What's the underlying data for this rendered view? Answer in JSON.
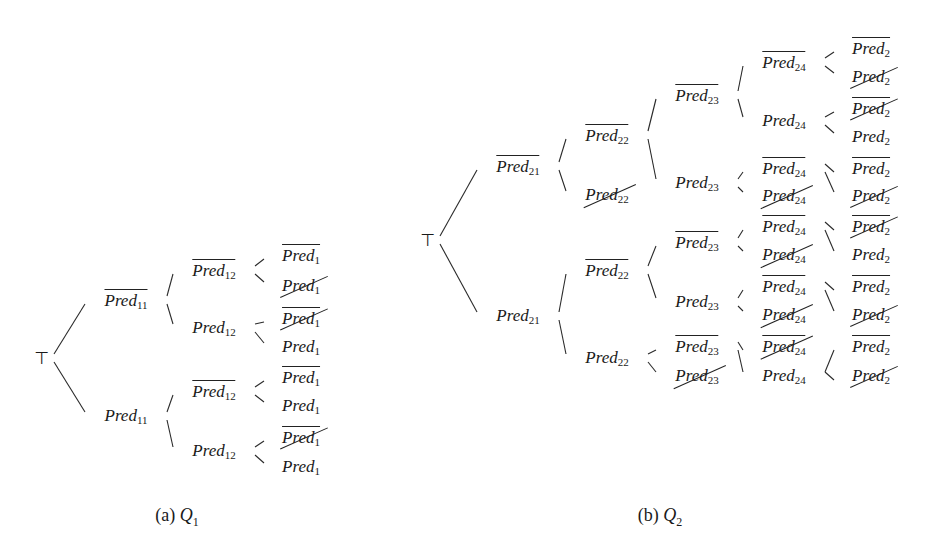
{
  "figure": {
    "captions": [
      {
        "id": "a",
        "label": "(a)",
        "var": "Q",
        "sub": "1",
        "x": 177,
        "y": 505
      },
      {
        "id": "b",
        "label": "(b)",
        "var": "Q",
        "sub": "2",
        "x": 660,
        "y": 505
      }
    ],
    "trees": [
      {
        "id": "Q1",
        "root": {
          "symbol": "⊤",
          "x": 42,
          "y": 358
        },
        "nodes": [
          {
            "id": "a1",
            "base": "Pred",
            "sub": "11",
            "neg": true,
            "struck": false,
            "x": 126,
            "y": 300,
            "parent": "root"
          },
          {
            "id": "a2",
            "base": "Pred",
            "sub": "11",
            "neg": false,
            "struck": false,
            "x": 126,
            "y": 416,
            "parent": "root"
          },
          {
            "id": "a3",
            "base": "Pred",
            "sub": "12",
            "neg": true,
            "struck": false,
            "x": 214,
            "y": 270,
            "parent": "a1"
          },
          {
            "id": "a4",
            "base": "Pred",
            "sub": "12",
            "neg": false,
            "struck": false,
            "x": 214,
            "y": 328,
            "parent": "a1"
          },
          {
            "id": "a5",
            "base": "Pred",
            "sub": "12",
            "neg": true,
            "struck": false,
            "x": 214,
            "y": 391,
            "parent": "a2"
          },
          {
            "id": "a6",
            "base": "Pred",
            "sub": "12",
            "neg": false,
            "struck": false,
            "x": 214,
            "y": 451,
            "parent": "a2"
          },
          {
            "id": "a7",
            "base": "Pred",
            "sub": "1",
            "neg": true,
            "struck": false,
            "x": 301,
            "y": 255,
            "parent": "a3"
          },
          {
            "id": "a8",
            "base": "Pred",
            "sub": "1",
            "neg": false,
            "struck": true,
            "x": 301,
            "y": 286,
            "parent": "a3"
          },
          {
            "id": "a9",
            "base": "Pred",
            "sub": "1",
            "neg": true,
            "struck": true,
            "x": 301,
            "y": 318,
            "parent": "a4"
          },
          {
            "id": "a10",
            "base": "Pred",
            "sub": "1",
            "neg": false,
            "struck": false,
            "x": 301,
            "y": 347,
            "parent": "a4"
          },
          {
            "id": "a11",
            "base": "Pred",
            "sub": "1",
            "neg": true,
            "struck": false,
            "x": 301,
            "y": 377,
            "parent": "a5"
          },
          {
            "id": "a12",
            "base": "Pred",
            "sub": "1",
            "neg": false,
            "struck": false,
            "x": 301,
            "y": 406,
            "parent": "a5"
          },
          {
            "id": "a13",
            "base": "Pred",
            "sub": "1",
            "neg": true,
            "struck": true,
            "x": 301,
            "y": 437,
            "parent": "a6"
          },
          {
            "id": "a14",
            "base": "Pred",
            "sub": "1",
            "neg": false,
            "struck": false,
            "x": 301,
            "y": 467,
            "parent": "a6"
          }
        ]
      },
      {
        "id": "Q2",
        "root": {
          "symbol": "⊤",
          "x": 428,
          "y": 240
        },
        "nodes": [
          {
            "id": "b1",
            "base": "Pred",
            "sub": "21",
            "neg": true,
            "struck": false,
            "x": 518,
            "y": 166,
            "parent": "root"
          },
          {
            "id": "b2",
            "base": "Pred",
            "sub": "21",
            "neg": false,
            "struck": false,
            "x": 518,
            "y": 316,
            "parent": "root"
          },
          {
            "id": "b3",
            "base": "Pred",
            "sub": "22",
            "neg": true,
            "struck": false,
            "x": 607,
            "y": 135,
            "parent": "b1"
          },
          {
            "id": "b4",
            "base": "Pred",
            "sub": "22",
            "neg": false,
            "struck": true,
            "x": 607,
            "y": 195,
            "parent": "b1"
          },
          {
            "id": "b5",
            "base": "Pred",
            "sub": "22",
            "neg": true,
            "struck": false,
            "x": 607,
            "y": 270,
            "parent": "b2"
          },
          {
            "id": "b6",
            "base": "Pred",
            "sub": "22",
            "neg": false,
            "struck": false,
            "x": 607,
            "y": 358,
            "parent": "b2"
          },
          {
            "id": "b7",
            "base": "Pred",
            "sub": "23",
            "neg": true,
            "struck": false,
            "x": 697,
            "y": 95,
            "parent": "b3"
          },
          {
            "id": "b8",
            "base": "Pred",
            "sub": "23",
            "neg": false,
            "struck": false,
            "x": 697,
            "y": 183,
            "parent": "b3"
          },
          {
            "id": "b9",
            "base": "Pred",
            "sub": "23",
            "neg": true,
            "struck": false,
            "x": 697,
            "y": 242,
            "parent": "b5"
          },
          {
            "id": "b10",
            "base": "Pred",
            "sub": "23",
            "neg": false,
            "struck": false,
            "x": 697,
            "y": 302,
            "parent": "b5"
          },
          {
            "id": "b11",
            "base": "Pred",
            "sub": "23",
            "neg": true,
            "struck": false,
            "x": 697,
            "y": 346,
            "parent": "b6"
          },
          {
            "id": "b12",
            "base": "Pred",
            "sub": "23",
            "neg": false,
            "struck": true,
            "x": 697,
            "y": 376,
            "parent": "b6"
          },
          {
            "id": "b13",
            "base": "Pred",
            "sub": "24",
            "neg": true,
            "struck": false,
            "x": 784,
            "y": 62,
            "parent": "b7"
          },
          {
            "id": "b14",
            "base": "Pred",
            "sub": "24",
            "neg": false,
            "struck": false,
            "x": 784,
            "y": 121,
            "parent": "b7"
          },
          {
            "id": "b15",
            "base": "Pred",
            "sub": "24",
            "neg": true,
            "struck": false,
            "x": 784,
            "y": 168,
            "parent": "b8"
          },
          {
            "id": "b16",
            "base": "Pred",
            "sub": "24",
            "neg": false,
            "struck": true,
            "x": 784,
            "y": 196,
            "parent": "b8"
          },
          {
            "id": "b17",
            "base": "Pred",
            "sub": "24",
            "neg": true,
            "struck": false,
            "x": 784,
            "y": 226,
            "parent": "b9"
          },
          {
            "id": "b18",
            "base": "Pred",
            "sub": "24",
            "neg": false,
            "struck": true,
            "x": 784,
            "y": 255,
            "parent": "b9"
          },
          {
            "id": "b19",
            "base": "Pred",
            "sub": "24",
            "neg": true,
            "struck": false,
            "x": 784,
            "y": 286,
            "parent": "b10"
          },
          {
            "id": "b20",
            "base": "Pred",
            "sub": "24",
            "neg": false,
            "struck": true,
            "x": 784,
            "y": 315,
            "parent": "b10"
          },
          {
            "id": "b21",
            "base": "Pred",
            "sub": "24",
            "neg": true,
            "struck": true,
            "x": 784,
            "y": 346,
            "parent": "b11"
          },
          {
            "id": "b22",
            "base": "Pred",
            "sub": "24",
            "neg": false,
            "struck": false,
            "x": 784,
            "y": 376,
            "parent": "b11"
          },
          {
            "id": "b23",
            "base": "Pred",
            "sub": "2",
            "neg": true,
            "struck": false,
            "x": 871,
            "y": 48,
            "parent": "b13"
          },
          {
            "id": "b24",
            "base": "Pred",
            "sub": "2",
            "neg": false,
            "struck": true,
            "x": 871,
            "y": 77,
            "parent": "b13"
          },
          {
            "id": "b25",
            "base": "Pred",
            "sub": "2",
            "neg": true,
            "struck": true,
            "x": 871,
            "y": 108,
            "parent": "b14"
          },
          {
            "id": "b26",
            "base": "Pred",
            "sub": "2",
            "neg": false,
            "struck": false,
            "x": 871,
            "y": 137,
            "parent": "b14"
          },
          {
            "id": "b27",
            "base": "Pred",
            "sub": "2",
            "neg": true,
            "struck": false,
            "x": 871,
            "y": 168,
            "parent": "b15"
          },
          {
            "id": "b28",
            "base": "Pred",
            "sub": "2",
            "neg": false,
            "struck": true,
            "x": 871,
            "y": 196,
            "parent": "b15"
          },
          {
            "id": "b29",
            "base": "Pred",
            "sub": "2",
            "neg": true,
            "struck": true,
            "x": 871,
            "y": 226,
            "parent": "b17"
          },
          {
            "id": "b30",
            "base": "Pred",
            "sub": "2",
            "neg": false,
            "struck": false,
            "x": 871,
            "y": 255,
            "parent": "b17"
          },
          {
            "id": "b31",
            "base": "Pred",
            "sub": "2",
            "neg": true,
            "struck": false,
            "x": 871,
            "y": 286,
            "parent": "b19"
          },
          {
            "id": "b32",
            "base": "Pred",
            "sub": "2",
            "neg": false,
            "struck": true,
            "x": 871,
            "y": 315,
            "parent": "b19"
          },
          {
            "id": "b33",
            "base": "Pred",
            "sub": "2",
            "neg": true,
            "struck": false,
            "x": 871,
            "y": 346,
            "parent": "b22"
          },
          {
            "id": "b34",
            "base": "Pred",
            "sub": "2",
            "neg": false,
            "struck": true,
            "x": 871,
            "y": 376,
            "parent": "b22"
          }
        ]
      }
    ]
  }
}
